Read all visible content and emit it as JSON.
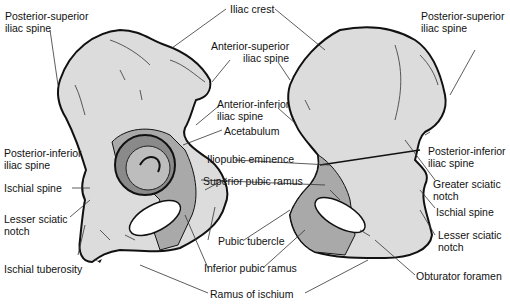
{
  "diagram": {
    "colors": {
      "bone": "#dcdcdc",
      "pubis_shade": "#a9a9a9",
      "outline": "#111111",
      "leader": "#333333"
    },
    "labels": {
      "iliac_crest": "Iliac crest",
      "left_psis": "Posterior-superior\niliac spine",
      "asis": "Anterior-superior\niliac spine",
      "aiis": "Anterior-inferior\niliac spine",
      "acetabulum": "Acetabulum",
      "iliopubic_eminence": "Iliopubic eminence",
      "superior_pubic_ramus": "Superior pubic ramus",
      "left_pisis": "Posterior-inferior\niliac spine",
      "left_ischial_spine": "Ischial spine",
      "left_lesser_sciatic": "Lesser sciatic\nnotch",
      "ischial_tuberosity": "Ischial tuberosity",
      "pubic_tubercle": "Pubic tubercle",
      "inferior_pubic_ramus": "Inferior pubic ramus",
      "ramus_of_ischium": "Ramus of ischium",
      "right_psis": "Posterior-superior\niliac spine",
      "right_pisis": "Posterior-inferior\niliac spine",
      "greater_sciatic": "Greater sciatic\nnotch",
      "right_ischial_spine": "Ischial spine",
      "right_lesser_sciatic": "Lesser sciatic\nnotch",
      "obturator_foramen": "Obturator foramen"
    }
  }
}
